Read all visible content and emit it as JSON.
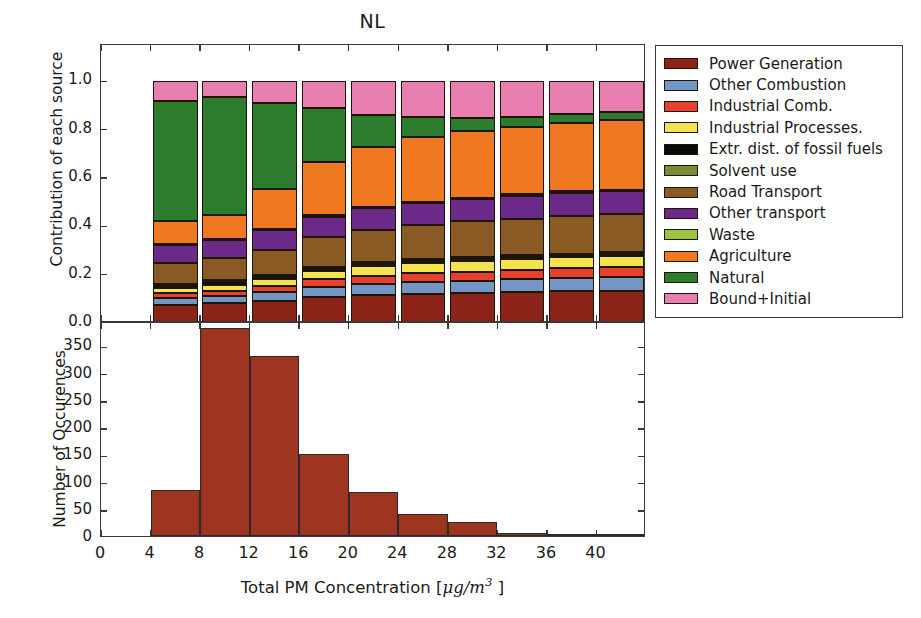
{
  "chart_data": {
    "type": "bar",
    "title": "NL",
    "xlabel": "Total PM Concentration [μg/m³ ]",
    "xlabel_parts": {
      "text_before": "Total PM Concentration [",
      "unit_mu": "μg/m",
      "unit_exp": "3",
      "text_after": " ]"
    },
    "panels": [
      {
        "name": "stacked-contribution",
        "ylabel": "Contribution of each source",
        "ylim": [
          0.0,
          1.15
        ],
        "yticks": [
          0.0,
          0.2,
          0.4,
          0.6,
          0.8,
          1.0
        ],
        "ytick_labels": [
          "0.0",
          "0.2",
          "0.4",
          "0.6",
          "0.8",
          "1.0"
        ],
        "xlim": [
          0,
          44
        ],
        "grid": false,
        "stacked": true,
        "bin_edges": [
          4,
          8,
          12,
          16,
          20,
          24,
          28,
          32,
          36,
          40,
          44
        ],
        "bin_centers": [
          6,
          10,
          14,
          18,
          22,
          26,
          30,
          34,
          38,
          42
        ],
        "series": [
          {
            "name": "Power Generation",
            "color": "#8c2318",
            "values": [
              0.075,
              0.082,
              0.092,
              0.108,
              0.115,
              0.12,
              0.123,
              0.128,
              0.131,
              0.133
            ]
          },
          {
            "name": "Other Combustion",
            "color": "#7396c4",
            "values": [
              0.028,
              0.03,
              0.035,
              0.042,
              0.047,
              0.05,
              0.052,
              0.053,
              0.055,
              0.056
            ]
          },
          {
            "name": "Industrial Comb.",
            "color": "#e8402f",
            "values": [
              0.02,
              0.022,
              0.026,
              0.031,
              0.034,
              0.036,
              0.038,
              0.039,
              0.04,
              0.041
            ]
          },
          {
            "name": "Industrial Processes.",
            "color": "#f2e34f",
            "values": [
              0.022,
              0.024,
              0.029,
              0.035,
              0.039,
              0.041,
              0.043,
              0.044,
              0.045,
              0.046
            ]
          },
          {
            "name": "Extr. dist. of fossil fuels",
            "color": "#0a0a0a",
            "values": [
              0.01,
              0.01,
              0.009,
              0.008,
              0.008,
              0.008,
              0.008,
              0.008,
              0.008,
              0.008
            ]
          },
          {
            "name": "Solvent use",
            "color": "#7f8b32",
            "values": [
              0.008,
              0.008,
              0.008,
              0.008,
              0.008,
              0.008,
              0.008,
              0.008,
              0.008,
              0.008
            ]
          },
          {
            "name": "Road Transport",
            "color": "#8a5a25",
            "values": [
              0.086,
              0.092,
              0.104,
              0.122,
              0.133,
              0.142,
              0.148,
              0.152,
              0.156,
              0.158
            ]
          },
          {
            "name": "Other transport",
            "color": "#6b2a8a",
            "values": [
              0.072,
              0.074,
              0.08,
              0.086,
              0.09,
              0.092,
              0.094,
              0.095,
              0.096,
              0.097
            ]
          },
          {
            "name": "Waste",
            "color": "#9dc343",
            "values": [
              0.005,
              0.005,
              0.005,
              0.005,
              0.005,
              0.005,
              0.005,
              0.005,
              0.005,
              0.005
            ]
          },
          {
            "name": "Agriculture",
            "color": "#f07820",
            "values": [
              0.096,
              0.1,
              0.168,
              0.221,
              0.251,
              0.267,
              0.275,
              0.28,
              0.285,
              0.288
            ]
          },
          {
            "name": "Natural",
            "color": "#2d7b2d",
            "values": [
              0.497,
              0.486,
              0.354,
              0.224,
              0.131,
              0.082,
              0.054,
              0.042,
              0.036,
              0.032
            ]
          },
          {
            "name": "Bound+Initial",
            "color": "#e87fb0",
            "values": [
              0.081,
              0.067,
              0.09,
              0.11,
              0.139,
              0.149,
              0.152,
              0.146,
              0.135,
              0.128
            ]
          }
        ]
      },
      {
        "name": "occurrence-histogram",
        "ylabel": "Number of Occurences",
        "ylim": [
          0,
          395
        ],
        "yticks": [
          0,
          50,
          100,
          150,
          200,
          250,
          300,
          350
        ],
        "ytick_labels": [
          "0",
          "50",
          "100",
          "150",
          "200",
          "250",
          "300",
          "350"
        ],
        "xlim": [
          0,
          44
        ],
        "xticks": [
          0,
          4,
          8,
          12,
          16,
          20,
          24,
          28,
          32,
          36,
          40
        ],
        "xtick_labels": [
          "0",
          "4",
          "8",
          "12",
          "16",
          "20",
          "24",
          "28",
          "32",
          "36",
          "40"
        ],
        "bar_color": "#9e3520",
        "bin_edges": [
          4,
          8,
          12,
          16,
          20,
          24,
          28,
          32,
          36,
          40,
          44
        ],
        "values": [
          84,
          382,
          331,
          151,
          81,
          41,
          25,
          6,
          3,
          1
        ]
      }
    ],
    "legend": {
      "position": "right",
      "entries": [
        {
          "label": "Power Generation",
          "color": "#8c2318"
        },
        {
          "label": "Other Combustion",
          "color": "#7396c4"
        },
        {
          "label": "Industrial Comb.",
          "color": "#e8402f"
        },
        {
          "label": "Industrial Processes.",
          "color": "#f2e34f"
        },
        {
          "label": "Extr. dist. of fossil fuels",
          "color": "#0a0a0a"
        },
        {
          "label": "Solvent use",
          "color": "#7f8b32"
        },
        {
          "label": "Road Transport",
          "color": "#8a5a25"
        },
        {
          "label": "Other transport",
          "color": "#6b2a8a"
        },
        {
          "label": "Waste",
          "color": "#9dc343"
        },
        {
          "label": "Agriculture",
          "color": "#f07820"
        },
        {
          "label": "Natural",
          "color": "#2d7b2d"
        },
        {
          "label": "Bound+Initial",
          "color": "#e87fb0"
        }
      ]
    }
  }
}
